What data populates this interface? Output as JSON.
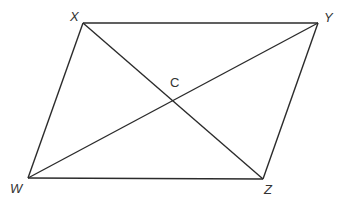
{
  "diagram": {
    "type": "parallelogram-with-diagonals",
    "stroke_color": "#2b2b2b",
    "vertices": [
      {
        "name": "X",
        "label": "X",
        "x": 83,
        "y": 23,
        "label_x": 70,
        "label_y": 21
      },
      {
        "name": "Y",
        "label": "Y",
        "x": 318,
        "y": 23,
        "label_x": 324,
        "label_y": 22
      },
      {
        "name": "Z",
        "label": "Z",
        "x": 263,
        "y": 179,
        "label_x": 264,
        "label_y": 194
      },
      {
        "name": "W",
        "label": "W",
        "x": 28,
        "y": 178,
        "label_x": 10,
        "label_y": 193
      }
    ],
    "intersection": {
      "name": "C",
      "label": "C",
      "x": 173,
      "y": 101,
      "label_x": 170,
      "label_y": 87
    },
    "sides": [
      "XY",
      "YZ",
      "ZW",
      "WX"
    ],
    "diagonals": [
      "XZ",
      "WY"
    ]
  }
}
